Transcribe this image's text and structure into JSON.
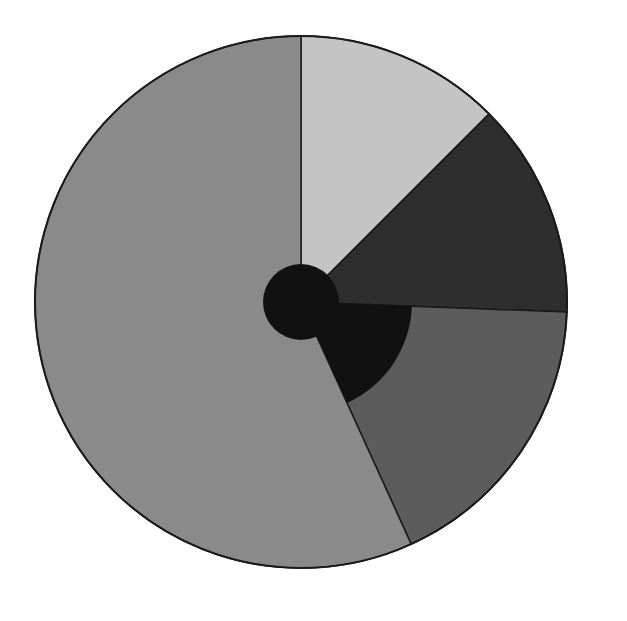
{
  "chart_data": {
    "type": "pie",
    "title": "",
    "legend": [],
    "center": [
      301,
      302
    ],
    "radius": 266,
    "start_angle_deg": 0,
    "direction": "clockwise",
    "slices": [
      {
        "label": "",
        "value": 12.5,
        "color": "#c4c4c4"
      },
      {
        "label": "",
        "value": 13.1,
        "color": "#2e2e2e"
      },
      {
        "label": "",
        "value": 17.6,
        "color": "#5c5c5c"
      },
      {
        "label": "",
        "value": 56.8,
        "color": "#8a8a8a"
      }
    ],
    "inner_overlays": [
      {
        "shape": "circle",
        "radius": 38,
        "color": "#111111"
      },
      {
        "shape": "wedge",
        "from_deg": 92,
        "to_deg": 155.5,
        "radius": 111,
        "color": "#111111"
      }
    ],
    "outline_color": "#1a1a1a"
  }
}
